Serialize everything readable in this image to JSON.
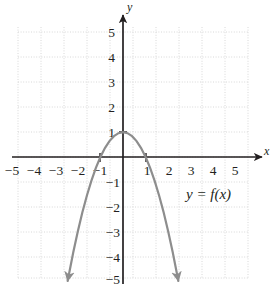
{
  "figure": {
    "background_color": "#ffffff",
    "axis_color": "#231f20",
    "grid_color": "#d9d9d9",
    "curve_color": "#8d8d8d",
    "label_color": "#231f20"
  },
  "chart_data": {
    "type": "line",
    "title": "",
    "subtitle": "",
    "xlabel": "x",
    "ylabel": "y",
    "xlim": [
      -5.6,
      5.6
    ],
    "ylim": [
      -5.6,
      5.6
    ],
    "xticks": [
      -5,
      -4,
      -3,
      -2,
      -1,
      1,
      2,
      3,
      4,
      5
    ],
    "yticks": [
      5,
      4,
      3,
      2,
      1,
      -1,
      -2,
      -3,
      -4,
      -5
    ],
    "xtick_labels": [
      "−5",
      "−4",
      "−3",
      "−2",
      "−1",
      "1",
      "2",
      "3",
      "4",
      "5"
    ],
    "ytick_labels": [
      "5",
      "4",
      "3",
      "2",
      "1",
      "−1",
      "−2",
      "−3",
      "−4",
      "−5"
    ],
    "grid": true,
    "grid_style": "dotted",
    "legend": "none",
    "annotations": [
      {
        "text": "y = f(x)",
        "x": 2.8,
        "y": -1.6
      }
    ],
    "series": [
      {
        "name": "f(x)",
        "equation": "y = 1 - x^2",
        "color": "#8d8d8d",
        "vertex": [
          0,
          1
        ],
        "x_intercepts": [
          -1,
          1
        ],
        "y_intercept": 1,
        "opens": "down",
        "arrows": [
          "start",
          "end"
        ],
        "x": [
          -2.45,
          -2.2,
          -2.0,
          -1.8,
          -1.6,
          -1.4,
          -1.2,
          -1.0,
          -0.8,
          -0.6,
          -0.4,
          -0.2,
          0.0,
          0.2,
          0.4,
          0.6,
          0.8,
          1.0,
          1.2,
          1.4,
          1.6,
          1.8,
          2.0,
          2.2,
          2.45
        ],
        "y": [
          -5.0,
          -3.84,
          -3.0,
          -2.24,
          -1.56,
          -0.96,
          -0.44,
          0.0,
          0.36,
          0.64,
          0.84,
          0.96,
          1.0,
          0.96,
          0.84,
          0.64,
          0.36,
          0.0,
          -0.44,
          -0.96,
          -1.56,
          -2.24,
          -3.0,
          -3.84,
          -5.0
        ]
      }
    ]
  },
  "labels": {
    "x_axis_name": "x",
    "y_axis_name": "y",
    "function_label": "y = f(x)",
    "function_label_parts": {
      "y": "y",
      "equals": "=",
      "f": "f",
      "open_paren": "(",
      "arg": "x",
      "close_paren": ")"
    },
    "x_neg5": "−5",
    "x_neg4": "−4",
    "x_neg3": "−3",
    "x_neg2": "−2",
    "x_neg1": "−1",
    "x_1": "1",
    "x_2": "2",
    "x_3": "3",
    "x_4": "4",
    "x_5": "5",
    "y_5": "5",
    "y_4": "4",
    "y_3": "3",
    "y_2": "2",
    "y_1": "1",
    "y_neg1": "−1",
    "y_neg2": "−2",
    "y_neg3": "−3",
    "y_neg4": "−4",
    "y_neg5": "−5"
  }
}
